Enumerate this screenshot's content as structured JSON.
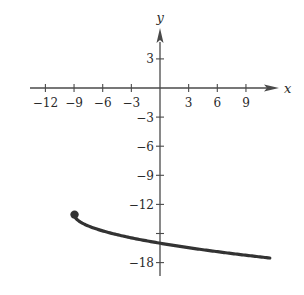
{
  "chart_data": {
    "type": "line",
    "title": "",
    "xlabel": "x",
    "ylabel": "y",
    "xlim": [
      -13.5,
      13
    ],
    "ylim": [
      -19.5,
      6.5
    ],
    "grid": false,
    "legend": null,
    "x_ticks": [
      -12,
      -9,
      -6,
      -3,
      3,
      6,
      9
    ],
    "x_tick_labels": [
      "−12",
      "−9",
      "−6",
      "−3",
      "3",
      "6",
      "9"
    ],
    "y_ticks": [
      3,
      -3,
      -6,
      -9,
      -12,
      -15,
      -18
    ],
    "y_tick_labels": [
      "3",
      "−3",
      "−6",
      "−9",
      "−12",
      "",
      "−18"
    ],
    "series": [
      {
        "name": "curve",
        "equation_estimate": "y = -sqrt(x + 9) - 13",
        "start_point": {
          "x": -9,
          "y": -13,
          "marker": "closed-dot"
        },
        "x": [
          -9,
          -8,
          -7,
          -5,
          -3,
          0,
          3,
          6,
          9,
          11.5
        ],
        "y": [
          -13,
          -14,
          -14.41,
          -15,
          -15.46,
          -16,
          -16.46,
          -16.87,
          -17.24,
          -17.53
        ],
        "color": "#333333"
      }
    ]
  },
  "axes": {
    "x_name": "x",
    "y_name": "y"
  },
  "colors": {
    "axis": "#4a4a4a",
    "curve": "#333333",
    "background": "#ffffff"
  }
}
